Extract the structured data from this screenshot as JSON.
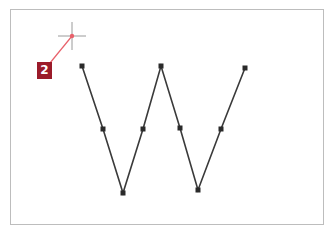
{
  "figure": {
    "step_badge": {
      "label": "2",
      "color": "#9b1b2a"
    },
    "colors": {
      "path_stroke": "#3a3a3a",
      "anchor_fill": "#2a2a2a",
      "pointer_line": "#e8616b",
      "crosshair": "#9a9a9a",
      "frame_border": "#bdbdbd"
    },
    "cursor": {
      "type": "crosshair-icon",
      "x": 72,
      "y": 36
    },
    "path": {
      "shape": "W",
      "anchors": [
        {
          "x": 82,
          "y": 66
        },
        {
          "x": 103,
          "y": 129
        },
        {
          "x": 123,
          "y": 193
        },
        {
          "x": 143,
          "y": 129
        },
        {
          "x": 161,
          "y": 66
        },
        {
          "x": 180,
          "y": 128
        },
        {
          "x": 198,
          "y": 190
        },
        {
          "x": 221,
          "y": 129
        },
        {
          "x": 245,
          "y": 68
        }
      ]
    }
  }
}
